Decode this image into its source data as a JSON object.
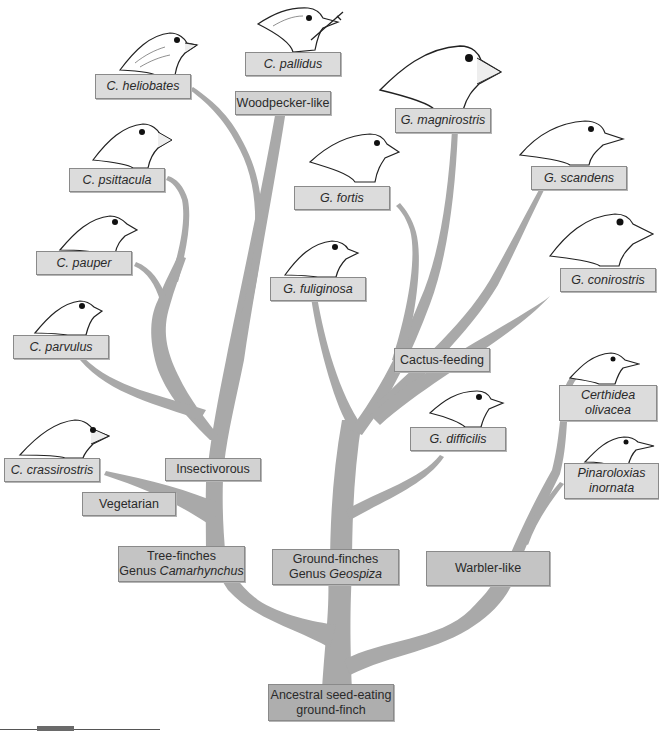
{
  "diagram": {
    "branch_color": "#a9a9a9",
    "label_bg": "#dcdcdc",
    "root": {
      "label_line1": "Ancestral seed-eating",
      "label_line2": "ground-finch"
    },
    "groups": [
      {
        "id": "tree-finches",
        "line1": "Tree-finches",
        "line2_prefix": "Genus ",
        "line2_genus": "Camarhynchus"
      },
      {
        "id": "ground-finches",
        "line1": "Ground-finches",
        "line2_prefix": "Genus ",
        "line2_genus": "Geospiza"
      },
      {
        "id": "warbler-like",
        "line1": "Warbler-like"
      }
    ],
    "traits": {
      "woodpecker": "Woodpecker-like",
      "insectivorous": "Insectivorous",
      "vegetarian": "Vegetarian",
      "cactus": "Cactus-feeding"
    },
    "species": {
      "heliobates": "C. heliobates",
      "pallidus": "C. pallidus",
      "psittacula": "C. psittacula",
      "pauper": "C. pauper",
      "parvulus": "C. parvulus",
      "crassirostris": "C. crassirostris",
      "magnirostris": "G. magnirostris",
      "fortis": "G. fortis",
      "fuliginosa": "G. fuliginosa",
      "scandens": "G. scandens",
      "conirostris": "G. conirostris",
      "difficilis": "G. difficilis",
      "certhidea_1": "Certhidea",
      "certhidea_2": "olivacea",
      "pinaroloxias_1": "Pinaroloxias",
      "pinaroloxias_2": "inornata"
    }
  }
}
